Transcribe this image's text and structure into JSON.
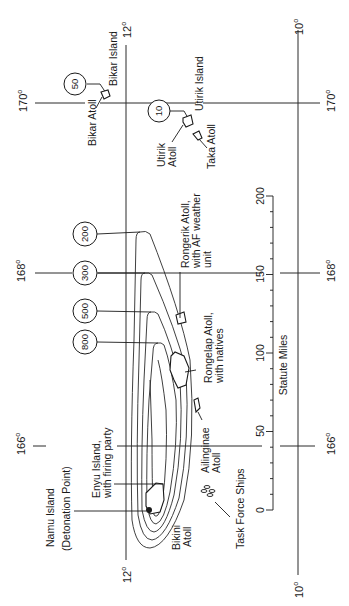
{
  "map": {
    "orientation": "rotated 90 degrees counter-clockwise",
    "latitude_labels": [
      {
        "value": "12",
        "unit": "o"
      },
      {
        "value": "10",
        "unit": "o"
      }
    ],
    "longitude_labels": [
      {
        "value": "170",
        "unit": "o"
      },
      {
        "value": "168",
        "unit": "o"
      },
      {
        "value": "166",
        "unit": "o"
      }
    ],
    "grid": {
      "lat_12": "12",
      "lat_10": "10",
      "lon_170": "170",
      "lon_168": "168",
      "lon_166": "166",
      "deg_symbol": "o"
    },
    "contour_labels": {
      "c50": "50",
      "c10": "10",
      "c200": "200",
      "c300": "300",
      "c500": "500",
      "c800": "800"
    },
    "places": {
      "bikar_island": "Bikar Island",
      "bikar_atoll": "Bikar Atoll",
      "utirik_island": "Utirik Island",
      "utirik_atoll_1": "Utirik",
      "utirik_atoll_2": "Atoll",
      "taka_atoll": "Taka Atoll",
      "rongerik_1": "Rongerik Atoll,",
      "rongerik_2": "with AF weather",
      "rongerik_3": "unit",
      "rongelap_1": "Rongelap Atoll,",
      "rongelap_2": "with natives",
      "ailinginae_1": "Ailinginae",
      "ailinginae_2": "Atoll",
      "enyu_1": "Enyu Island,",
      "enyu_2": "with firing party",
      "namu_1": "Namu Island",
      "namu_2": "(Detonation Point)",
      "bikini_1": "Bikini",
      "bikini_2": "Atoll",
      "task_force": "Task Force Ships"
    },
    "scale_bar": {
      "title": "Statute Miles",
      "ticks": [
        "0",
        "50",
        "100",
        "150",
        "200"
      ]
    }
  }
}
